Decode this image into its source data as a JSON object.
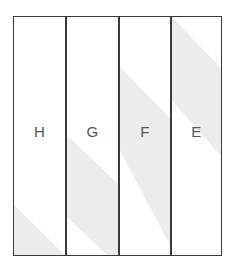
{
  "diagram": {
    "panels": [
      {
        "label": "H",
        "x": 0,
        "w": 51,
        "glare": "0,188 51,238 0,238"
      },
      {
        "label": "G",
        "x": 51,
        "w": 53,
        "glare": "0,118 53,168 53,238 0,238 0,216"
      },
      {
        "label": "F",
        "x": 104,
        "w": 52,
        "glare": "0,50 52,102 52,238 0,134"
      },
      {
        "label": "E",
        "x": 156,
        "w": 51,
        "glare": "0,0 51,44 51,142 0,74"
      }
    ],
    "colors": {
      "border": "#3a3a3a",
      "glare": "#ececec",
      "label": "#555555"
    }
  }
}
